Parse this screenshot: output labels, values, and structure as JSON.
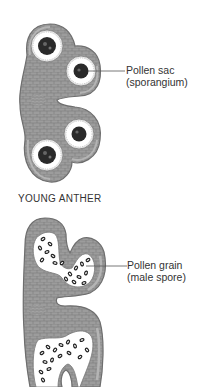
{
  "figure": {
    "young_anther": {
      "caption": "YOUNG ANTHER",
      "label": {
        "line1": "Pollen sac",
        "line2": "(sporangium)"
      }
    },
    "mature_anther": {
      "label": {
        "line1": "Pollen grain",
        "line2": "(male spore)"
      }
    }
  },
  "colors": {
    "tissue": "#9a9a9a",
    "tissue_outline": "#6e6e6e",
    "cell_lines": "#7a7a7a",
    "spore_mass": "#2a2a2a",
    "cavity": "#ffffff",
    "text": "#333333"
  }
}
